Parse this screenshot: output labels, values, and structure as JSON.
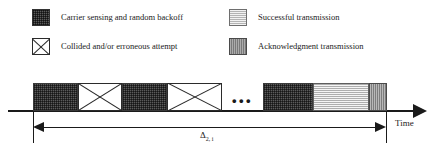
{
  "figure": {
    "type": "timing-diagram"
  },
  "legend": {
    "items": [
      {
        "swatch": "dark-speckled-square-icon",
        "pattern": "dark-checkered",
        "label": "Carrier sensing and random backoff"
      },
      {
        "swatch": "crossed-box-icon",
        "pattern": "white-with-x",
        "label": "Collided and/or erroneous attempt"
      },
      {
        "swatch": "light-gray-square-icon",
        "pattern": "light-gray",
        "label": "Successful transmission"
      },
      {
        "swatch": "medium-gray-square-icon",
        "pattern": "medium-gray",
        "label": "Acknowledgment transmission"
      }
    ]
  },
  "timeline": {
    "axis_label": "Time",
    "ellipsis": "•••",
    "duration": {
      "symbol": "Δ",
      "subscript": "2, i"
    },
    "segments": [
      {
        "kind": "backoff",
        "name": "carrier-sensing-block-1"
      },
      {
        "kind": "collision",
        "name": "collided-attempt-block-1"
      },
      {
        "kind": "backoff",
        "name": "carrier-sensing-block-2"
      },
      {
        "kind": "collision",
        "name": "collided-attempt-block-2"
      },
      {
        "kind": "ellipsis",
        "name": "segment-ellipsis"
      },
      {
        "kind": "backoff",
        "name": "carrier-sensing-block-3"
      },
      {
        "kind": "success",
        "name": "successful-transmission-block"
      },
      {
        "kind": "ack",
        "name": "acknowledgment-block"
      }
    ]
  },
  "colors": {
    "backoff": "#5b5b5b",
    "collision": "#ffffff",
    "success": "#cbcbcb",
    "ack": "#9a9a9a",
    "stroke": "#1a1a1a"
  }
}
